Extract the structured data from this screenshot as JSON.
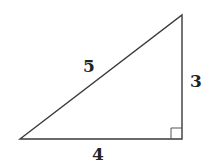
{
  "diagram": {
    "type": "right-triangle",
    "vertices": {
      "top": [
        182,
        15
      ],
      "right_angle": [
        182,
        139
      ],
      "bottom_left": [
        20,
        139
      ]
    },
    "right_angle_marker_size": 11,
    "stroke_color": "#3a3a3a",
    "labels": {
      "hypotenuse": "5",
      "vertical_leg": "3",
      "horizontal_leg": "4"
    }
  }
}
